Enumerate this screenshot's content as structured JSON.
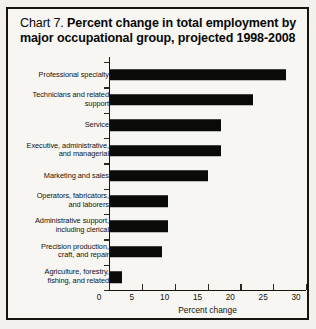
{
  "chart_data": {
    "type": "bar",
    "orientation": "horizontal",
    "title_lead": "Chart 7.",
    "title": "Percent change in total employment by major occupational group, projected 1998-2008",
    "xlabel": "Percent change",
    "ylabel": "",
    "xlim": [
      0,
      30
    ],
    "xticks": [
      0,
      5,
      10,
      15,
      20,
      25,
      30
    ],
    "grid": false,
    "legend": false,
    "categories": [
      "Professional specialty",
      "Technicians and related support",
      "Service",
      "Executive, administrative, and managerial",
      "Marketing and sales",
      "Operators, fabricators, and laborers",
      "Administrative support, including clerical",
      "Precision production, craft, and repair",
      "Agriculture, forestry, fishing, and related"
    ],
    "category_lines": [
      [
        "Professional specialty"
      ],
      [
        "Technicians and related",
        "support"
      ],
      [
        "Service"
      ],
      [
        "Executive, administrative,",
        "and managerial"
      ],
      [
        "Marketing and sales"
      ],
      [
        "Operators, fabricators,",
        "and laborers"
      ],
      [
        "Administrative support,",
        "including clerical"
      ],
      [
        "Precision production,",
        "craft, and repair"
      ],
      [
        "Agriculture, forestry,",
        "fishing, and related"
      ]
    ],
    "values": [
      27,
      22,
      17,
      17,
      15,
      9,
      9,
      8,
      2
    ],
    "bar_color": "#0a0a08"
  }
}
